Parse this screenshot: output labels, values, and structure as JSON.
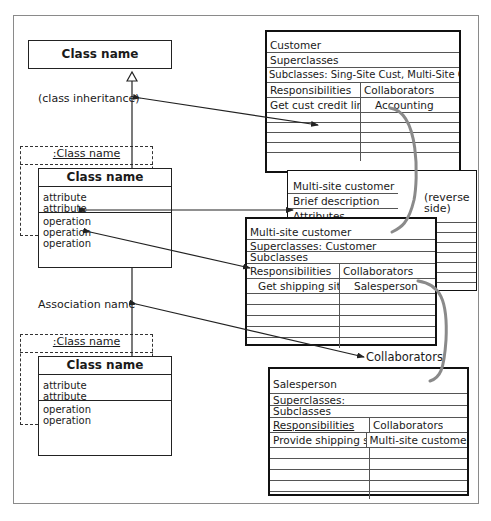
{
  "diagram": {
    "uml": {
      "top_class": {
        "name": "Class name"
      },
      "inheritance_label": "(class inheritance)",
      "association_label": "Association name",
      "object_1": {
        "instance_label": ":Class name",
        "name": "Class name",
        "attributes": [
          "attribute",
          "attribute"
        ],
        "operations": [
          "operation",
          "operation",
          "operation"
        ]
      },
      "object_2": {
        "instance_label": ":Class name",
        "name": "Class name",
        "attributes": [
          "attribute",
          "attribute"
        ],
        "operations": [
          "operation",
          "operation"
        ]
      }
    },
    "crc": {
      "customer": {
        "name": "Customer",
        "superclasses": "Superclasses",
        "subclasses": "Subclasses: Sing-Site Cust, Multi-Site Cust.",
        "responsibilities_header": "Responsibilities",
        "collaborators_header": "Collaborators",
        "rows": [
          {
            "responsibility": "Get cust credit limit",
            "collaborator": "Accounting"
          }
        ]
      },
      "superclass_subclass_label": "Superclass/subclass",
      "reverse_side": {
        "name": "Multi-site customer",
        "brief_description": "Brief description",
        "attributes": "Attributes",
        "note": [
          "(reverse",
          "side)"
        ]
      },
      "multi_site": {
        "name": "Multi-site customer",
        "superclasses": "Superclasses: Customer",
        "subclasses": "Subclasses",
        "responsibilities_header": "Responsibilities",
        "collaborators_header": "Collaborators",
        "rows": [
          {
            "responsibility": "Get shipping site",
            "collaborator": "Salesperson"
          }
        ]
      },
      "collaborators_label": "Collaborators",
      "salesperson": {
        "name": "Salesperson",
        "superclasses": "Superclasses:",
        "subclasses": "Subclasses",
        "responsibilities_header": "Responsibilities",
        "collaborators_header": "Collaborators",
        "rows": [
          {
            "responsibility": "Provide shipping site",
            "collaborator": "Multi-site customer"
          }
        ]
      }
    },
    "colors": {
      "line": "#222222",
      "curve": "#8a8a8a",
      "frame": "#8a8a8a"
    }
  }
}
